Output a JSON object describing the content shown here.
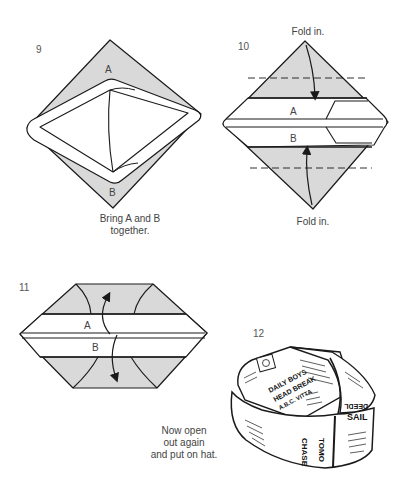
{
  "colors": {
    "shade": "#d9d9d9",
    "line": "#1a1a1a",
    "text": "#444444",
    "background": "#ffffff"
  },
  "steps": [
    {
      "number": "9",
      "labels": [
        "A",
        "B"
      ],
      "caption_lines": [
        "Bring A and B",
        "together."
      ]
    },
    {
      "number": "10",
      "labels": [
        "A",
        "B"
      ],
      "fold_top": "Fold in.",
      "fold_bottom": "Fold in."
    },
    {
      "number": "11",
      "labels": [
        "A",
        "B"
      ]
    },
    {
      "number": "12",
      "caption_lines": [
        "Now open",
        "out again",
        "and put on hat."
      ],
      "hat_print": [
        "DAILY BOYS",
        "HEAD BREAK",
        "A.B.C. VITTA",
        "CHASE",
        "TOMO",
        "SAIL",
        "DEEDL"
      ]
    }
  ]
}
